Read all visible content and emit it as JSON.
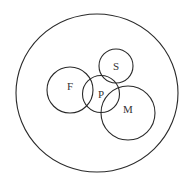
{
  "diagram": {
    "type": "venn-euler",
    "universe": {
      "label": ""
    },
    "sets": [
      {
        "id": "F",
        "label": "F"
      },
      {
        "id": "P",
        "label": "P"
      },
      {
        "id": "S",
        "label": "S"
      },
      {
        "id": "M",
        "label": "M"
      }
    ],
    "relations": [
      {
        "sets": [
          "F",
          "P"
        ],
        "overlap": true
      },
      {
        "sets": [
          "P",
          "S"
        ],
        "overlap": true
      },
      {
        "sets": [
          "P",
          "M"
        ],
        "overlap": true
      },
      {
        "sets": [
          "S",
          "M"
        ],
        "overlap": true
      },
      {
        "sets": [
          "F",
          "S"
        ],
        "overlap": false
      },
      {
        "sets": [
          "F",
          "M"
        ],
        "overlap": false
      }
    ],
    "stroke_color": "#2a2a2a",
    "label_color": "#333333",
    "background": "#ffffff"
  }
}
